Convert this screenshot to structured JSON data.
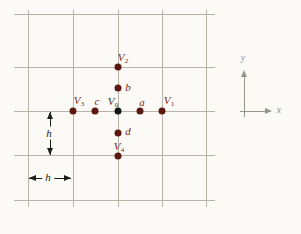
{
  "diagram": {
    "width": 301,
    "height": 234,
    "colors": {
      "background": "#fbfaf6",
      "grid": "#b9b3a7",
      "dot": "#5c180e",
      "center_dot": "#151515",
      "label": "#7c2618",
      "center_label": "#34302d",
      "measure": "#1d1d1d",
      "axis": "#97948e"
    },
    "grid": {
      "vertical_x": [
        28,
        73,
        118,
        162,
        206
      ],
      "vertical_y_range": [
        10,
        207
      ],
      "horizontal_y": [
        14,
        67,
        111,
        155,
        200
      ],
      "horizontal_x_range": [
        14,
        215
      ]
    },
    "points": [
      {
        "name": "V2",
        "base": "V",
        "sub": "2",
        "x": 118,
        "y": 67,
        "label_cx": 123,
        "label_cy": 58,
        "center": false
      },
      {
        "name": "b",
        "base": "b",
        "sub": "",
        "x": 118,
        "y": 88,
        "label_cx": 128,
        "label_cy": 87,
        "center": false
      },
      {
        "name": "V3",
        "base": "V",
        "sub": "3",
        "x": 73,
        "y": 111,
        "label_cx": 79,
        "label_cy": 101,
        "center": false
      },
      {
        "name": "c",
        "base": "c",
        "sub": "",
        "x": 95,
        "y": 111,
        "label_cx": 97,
        "label_cy": 101,
        "center": false
      },
      {
        "name": "V0",
        "base": "V",
        "sub": "0",
        "x": 118,
        "y": 111,
        "label_cx": 113,
        "label_cy": 102,
        "center": true
      },
      {
        "name": "a",
        "base": "a",
        "sub": "",
        "x": 140,
        "y": 111,
        "label_cx": 142,
        "label_cy": 102,
        "center": false
      },
      {
        "name": "V1",
        "base": "V",
        "sub": "1",
        "x": 162,
        "y": 111,
        "label_cx": 169,
        "label_cy": 101,
        "center": false
      },
      {
        "name": "d",
        "base": "d",
        "sub": "",
        "x": 118,
        "y": 133,
        "label_cx": 128,
        "label_cy": 131,
        "center": false
      },
      {
        "name": "V4",
        "base": "V",
        "sub": "4",
        "x": 118,
        "y": 156,
        "label_cx": 119,
        "label_cy": 147,
        "center": false
      }
    ],
    "measures": [
      {
        "name": "grid-spacing-vertical",
        "label": "h",
        "dir": "vertical",
        "x": 50,
        "from": 112,
        "to": 155,
        "label_cx": 49,
        "label_cy": 133
      },
      {
        "name": "grid-spacing-horizontal",
        "label": "h",
        "dir": "horizontal",
        "y": 178,
        "from": 29,
        "to": 71,
        "label_cx": 48,
        "label_cy": 177
      }
    ],
    "axes": {
      "origin": {
        "x": 244,
        "y": 111
      },
      "x_axis": {
        "label": "x",
        "from": 240,
        "to": 272,
        "label_cx": 279,
        "label_cy": 110
      },
      "y_axis": {
        "label": "y",
        "from": 70,
        "to": 117,
        "label_cx": 243,
        "label_cy": 58
      }
    }
  }
}
